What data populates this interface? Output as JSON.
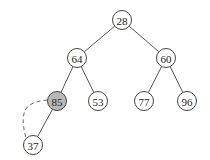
{
  "tree": {
    "nodes": [
      {
        "id": "n28",
        "label": "28",
        "x": 122,
        "y": 20,
        "highlight": false
      },
      {
        "id": "n64",
        "label": "64",
        "x": 77,
        "y": 58,
        "highlight": false
      },
      {
        "id": "n60",
        "label": "60",
        "x": 166,
        "y": 58,
        "highlight": false
      },
      {
        "id": "n85",
        "label": "85",
        "x": 57,
        "y": 101,
        "highlight": true
      },
      {
        "id": "n53",
        "label": "53",
        "x": 98,
        "y": 101,
        "highlight": false
      },
      {
        "id": "n77",
        "label": "77",
        "x": 144,
        "y": 101,
        "highlight": false
      },
      {
        "id": "n96",
        "label": "96",
        "x": 187,
        "y": 101,
        "highlight": false
      },
      {
        "id": "n37",
        "label": "37",
        "x": 33,
        "y": 145,
        "highlight": false
      }
    ],
    "edges": [
      [
        "n28",
        "n64"
      ],
      [
        "n28",
        "n60"
      ],
      [
        "n64",
        "n85"
      ],
      [
        "n64",
        "n53"
      ],
      [
        "n60",
        "n77"
      ],
      [
        "n60",
        "n96"
      ],
      [
        "n85",
        "n37"
      ]
    ],
    "dashed_arc": {
      "from": "n85",
      "to": "n37"
    }
  }
}
